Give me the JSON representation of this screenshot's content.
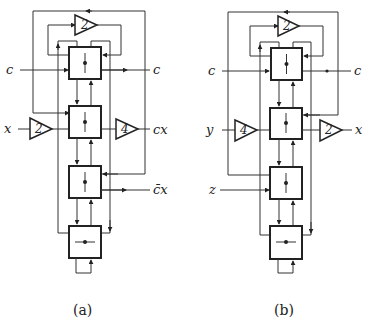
{
  "figure": {
    "subfigures": [
      {
        "id": "a",
        "caption": "(a)",
        "inputs": [
          "c",
          "x"
        ],
        "outputs": [
          "c",
          "cx",
          "c̄x"
        ],
        "gains": [
          "2",
          "2",
          "4"
        ],
        "blocks": 4
      },
      {
        "id": "b",
        "caption": "(b)",
        "inputs": [
          "c",
          "y",
          "z"
        ],
        "outputs": [
          "c",
          "x"
        ],
        "gains": [
          "2",
          "4",
          "2"
        ],
        "blocks": 4
      }
    ]
  },
  "a": {
    "in_c": "c",
    "in_x": "x",
    "out_c": "c",
    "out_cx": "cx",
    "out_cbarx": "c̄x",
    "gain_top": "2",
    "gain_in": "2",
    "gain_out": "4",
    "caption": "(a)"
  },
  "b": {
    "in_c": "c",
    "in_y": "y",
    "in_z": "z",
    "out_c": "c",
    "out_x": "x",
    "gain_top": "2",
    "gain_in": "4",
    "gain_out": "2",
    "caption": "(b)"
  }
}
